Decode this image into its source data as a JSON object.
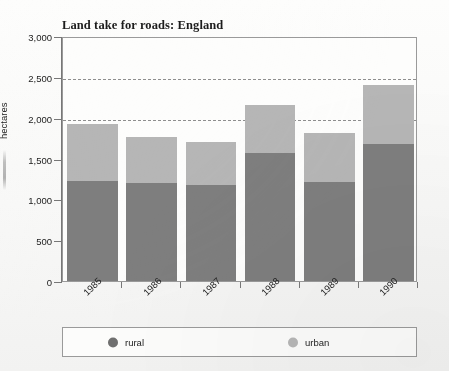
{
  "chart_data": {
    "type": "bar",
    "subtype": "stacked-bar",
    "title": "Land take for roads: England",
    "xlabel": "",
    "ylabel": "hectares",
    "categories": [
      "1985",
      "1986",
      "1987",
      "1988",
      "1989",
      "1990"
    ],
    "series": [
      {
        "name": "rural",
        "color": "#7e7e7e",
        "values": [
          1230,
          1205,
          1170,
          1565,
          1215,
          1680
        ]
      },
      {
        "name": "urban",
        "color": "#b6b6b6",
        "values": [
          695,
          555,
          535,
          590,
          595,
          720
        ]
      }
    ],
    "totals": [
      1925,
      1760,
      1705,
      2155,
      1810,
      2400
    ],
    "ylim": [
      0,
      3000
    ],
    "yticks": [
      0,
      500,
      1000,
      1500,
      2000,
      2500,
      3000
    ],
    "ytick_labels": [
      "0",
      "500",
      "1,000",
      "1,500",
      "2,000",
      "2,500",
      "3,000"
    ],
    "gridlines_at": [
      2000,
      2500
    ],
    "grid": "dashed-horizontal-partial",
    "legend_position": "bottom",
    "legend": [
      {
        "label": "rural",
        "color": "#6f6f6f",
        "marker": "circle"
      },
      {
        "label": "urban",
        "color": "#b6b6b6",
        "marker": "circle"
      }
    ]
  }
}
